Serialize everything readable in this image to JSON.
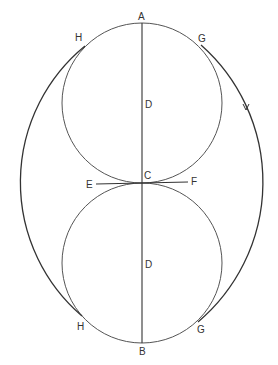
{
  "diagram": {
    "stroke_color": "#444444",
    "labels": {
      "A": "A",
      "B": "B",
      "C": "C",
      "D_upper": "D",
      "D_lower": "D",
      "E": "E",
      "F": "F",
      "H_upper": "H",
      "H_lower": "H",
      "G_upper": "G",
      "G_lower": "G"
    },
    "circles": [
      {
        "name": "upper-circle",
        "cx": 142,
        "cy": 103,
        "r": 80
      },
      {
        "name": "lower-circle",
        "cx": 142,
        "cy": 263,
        "r": 80
      }
    ],
    "outer_arcs": [
      {
        "name": "left-arc",
        "from": "H_upper",
        "to": "H_lower",
        "center": [
          193,
          185
        ],
        "r": 176
      },
      {
        "name": "right-arc",
        "from": "G_upper",
        "to": "G_lower",
        "center": [
          83,
          185
        ],
        "r": 183,
        "has_arrow": true
      }
    ],
    "lines": [
      {
        "name": "axis-AB",
        "from": "A",
        "to": "B"
      },
      {
        "name": "tangent-EF",
        "from": "E",
        "to": "F"
      }
    ]
  }
}
